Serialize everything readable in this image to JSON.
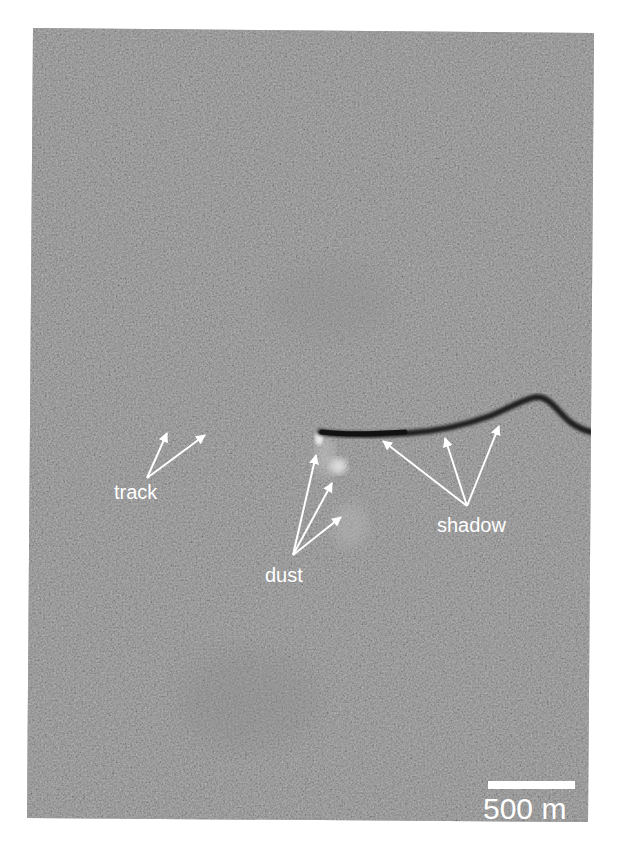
{
  "figure": {
    "background_color": "#7b7b7b",
    "annotation_color": "#ffffff",
    "labels": {
      "track": "track",
      "dust": "dust",
      "shadow": "shadow"
    },
    "scale_bar": {
      "label": "500 m"
    }
  }
}
